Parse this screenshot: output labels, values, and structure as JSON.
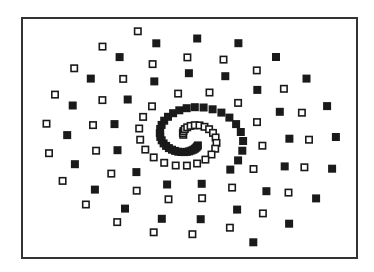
{
  "figure": {
    "frame": {
      "left": 21,
      "top": 17,
      "right": 356,
      "bottom": 257,
      "stroke": "#333333"
    },
    "center": {
      "x": 190,
      "y": 138
    },
    "colors": {
      "filled": "#1a1a1a",
      "hollow_stroke": "#1a1a1a",
      "hollow_fill": "#ffffff",
      "background": "#ffffff"
    }
  },
  "series": [
    {
      "name": "filled-squares",
      "style": "filled",
      "size": 8,
      "spiral": {
        "a": 6,
        "b": 13.5,
        "phase": 0.0,
        "theta_start": 0.9,
        "theta_end": 20.6,
        "aspect_y": 0.74,
        "inner_step": 0.09,
        "outer_step": 0.42,
        "dense_until": 7.0
      }
    },
    {
      "name": "hollow-squares",
      "style": "hollow",
      "size": 8,
      "spiral": {
        "a": 3,
        "b": 13.5,
        "phase": 3.14159,
        "theta_start": 0.5,
        "theta_end": 20.2,
        "aspect_y": 0.74,
        "inner_step": 0.22,
        "outer_step": 0.4,
        "dense_until": 7.0
      }
    }
  ]
}
